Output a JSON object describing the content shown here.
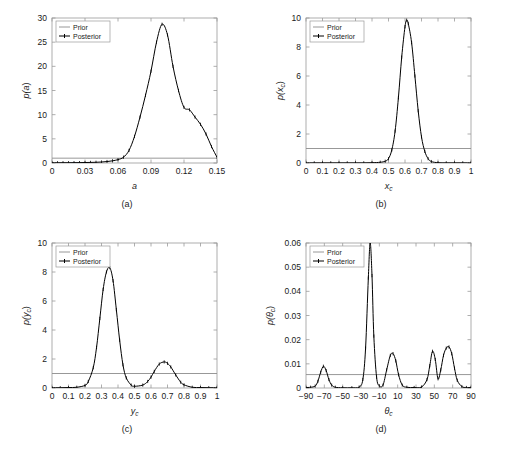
{
  "figure": {
    "panel_captions": [
      "(a)",
      "(b)",
      "(c)",
      "(d)"
    ],
    "legend": {
      "prior": "Prior",
      "posterior": "Posterior"
    },
    "colors": {
      "prior": "#8c8c8c",
      "posterior": "#000000",
      "axis": "#9a9a9a",
      "text": "#1a1a1a"
    }
  },
  "chart_data": [
    {
      "type": "line",
      "panel": "(a)",
      "title": "",
      "xlabel": "a",
      "ylabel": "p(a)",
      "xlim": [
        0,
        0.15
      ],
      "ylim": [
        0,
        30
      ],
      "xticks": [
        0,
        0.03,
        0.06,
        0.09,
        0.12,
        0.15
      ],
      "xticklabels": [
        "0",
        "0.03",
        "0.06",
        "0.09",
        "0.12",
        "0.15"
      ],
      "yticks": [
        0,
        5,
        10,
        15,
        20,
        25,
        30
      ],
      "yticklabels": [
        "0",
        "5",
        "10",
        "15",
        "20",
        "25",
        "30"
      ],
      "grid": false,
      "legend": [
        "Prior",
        "Posterior"
      ],
      "legend_position": "upper left",
      "series": [
        {
          "name": "Prior",
          "style": "solid-gray",
          "x": [
            0,
            0.15
          ],
          "values": [
            1.0,
            1.0
          ]
        },
        {
          "name": "Posterior",
          "style": "black-with-markers",
          "x": [
            0,
            0.005,
            0.01,
            0.015,
            0.02,
            0.025,
            0.03,
            0.035,
            0.04,
            0.045,
            0.05,
            0.055,
            0.06,
            0.065,
            0.07,
            0.075,
            0.08,
            0.085,
            0.09,
            0.095,
            0.1,
            0.105,
            0.11,
            0.115,
            0.12,
            0.125,
            0.13,
            0.135,
            0.14,
            0.145,
            0.15
          ],
          "values": [
            0.05,
            0.05,
            0.06,
            0.06,
            0.07,
            0.08,
            0.1,
            0.12,
            0.15,
            0.2,
            0.3,
            0.45,
            0.7,
            1.2,
            2.6,
            5.5,
            9.5,
            14.0,
            19.0,
            25.0,
            28.7,
            26.5,
            20.0,
            15.0,
            11.5,
            11.0,
            9.5,
            8.0,
            6.0,
            3.4,
            1.2
          ]
        }
      ]
    },
    {
      "type": "line",
      "panel": "(b)",
      "title": "",
      "xlabel": "x_c",
      "ylabel": "p(x_c)",
      "xlim": [
        0,
        1
      ],
      "ylim": [
        0,
        10
      ],
      "xticks": [
        0,
        0.1,
        0.2,
        0.3,
        0.4,
        0.5,
        0.6,
        0.7,
        0.8,
        0.9,
        1
      ],
      "xticklabels": [
        "0",
        "0.1",
        "0.2",
        "0.3",
        "0.4",
        "0.5",
        "0.6",
        "0.7",
        "0.8",
        "0.9",
        "1"
      ],
      "yticks": [
        0,
        2,
        4,
        6,
        8,
        10
      ],
      "yticklabels": [
        "0",
        "2",
        "4",
        "6",
        "8",
        "10"
      ],
      "grid": false,
      "legend": [
        "Prior",
        "Posterior"
      ],
      "legend_position": "upper left",
      "series": [
        {
          "name": "Prior",
          "style": "solid-gray",
          "x": [
            0,
            1
          ],
          "values": [
            1.0,
            1.0
          ]
        },
        {
          "name": "Posterior",
          "style": "black-with-markers",
          "x": [
            0,
            0.05,
            0.1,
            0.15,
            0.2,
            0.25,
            0.3,
            0.35,
            0.4,
            0.45,
            0.48,
            0.5,
            0.52,
            0.54,
            0.56,
            0.58,
            0.6,
            0.61,
            0.62,
            0.64,
            0.66,
            0.68,
            0.7,
            0.72,
            0.74,
            0.76,
            0.8,
            0.85,
            0.9,
            0.95,
            1
          ],
          "values": [
            0.01,
            0.01,
            0.01,
            0.01,
            0.01,
            0.01,
            0.01,
            0.01,
            0.02,
            0.05,
            0.12,
            0.3,
            0.9,
            2.2,
            4.5,
            7.3,
            9.4,
            9.85,
            9.6,
            8.3,
            6.0,
            3.6,
            1.8,
            0.8,
            0.3,
            0.1,
            0.02,
            0.01,
            0.01,
            0.01,
            0.01
          ]
        }
      ]
    },
    {
      "type": "line",
      "panel": "(c)",
      "title": "",
      "xlabel": "y_c",
      "ylabel": "p(y_c)",
      "xlim": [
        0,
        1
      ],
      "ylim": [
        0,
        10
      ],
      "xticks": [
        0,
        0.1,
        0.2,
        0.3,
        0.4,
        0.5,
        0.6,
        0.7,
        0.8,
        0.9,
        1
      ],
      "xticklabels": [
        "0",
        "0.1",
        "0.2",
        "0.3",
        "0.4",
        "0.5",
        "0.6",
        "0.7",
        "0.8",
        "0.9",
        "1"
      ],
      "yticks": [
        0,
        2,
        4,
        6,
        8,
        10
      ],
      "yticklabels": [
        "0",
        "2",
        "4",
        "6",
        "8",
        "10"
      ],
      "grid": false,
      "legend": [
        "Prior",
        "Posterior"
      ],
      "legend_position": "upper left",
      "series": [
        {
          "name": "Prior",
          "style": "solid-gray",
          "x": [
            0,
            1
          ],
          "values": [
            1.0,
            1.0
          ]
        },
        {
          "name": "Posterior",
          "style": "black-with-markers",
          "x": [
            0,
            0.05,
            0.1,
            0.15,
            0.2,
            0.22,
            0.25,
            0.27,
            0.29,
            0.31,
            0.33,
            0.35,
            0.37,
            0.39,
            0.41,
            0.43,
            0.45,
            0.48,
            0.5,
            0.55,
            0.58,
            0.6,
            0.62,
            0.65,
            0.68,
            0.7,
            0.72,
            0.75,
            0.78,
            0.8,
            0.85,
            0.9,
            0.95,
            1
          ],
          "values": [
            0.02,
            0.02,
            0.03,
            0.05,
            0.18,
            0.45,
            1.4,
            2.8,
            4.8,
            6.8,
            8.0,
            8.3,
            7.4,
            5.4,
            3.3,
            1.6,
            0.7,
            0.2,
            0.12,
            0.2,
            0.45,
            0.75,
            1.15,
            1.65,
            1.8,
            1.7,
            1.45,
            0.9,
            0.4,
            0.22,
            0.05,
            0.03,
            0.02,
            0.02
          ]
        }
      ]
    },
    {
      "type": "line",
      "panel": "(d)",
      "title": "",
      "xlabel": "theta_c",
      "ylabel": "p(theta_c)",
      "xlim": [
        -90,
        90
      ],
      "ylim": [
        0,
        0.06
      ],
      "xticks": [
        -90,
        -70,
        -50,
        -30,
        -10,
        10,
        30,
        50,
        70,
        90
      ],
      "xticklabels": [
        "−90",
        "−70",
        "−50",
        "−30",
        "−10",
        "10",
        "30",
        "50",
        "70",
        "90"
      ],
      "yticks": [
        0,
        0.01,
        0.02,
        0.03,
        0.04,
        0.05,
        0.06
      ],
      "yticklabels": [
        "0",
        "0.01",
        "0.02",
        "0.03",
        "0.04",
        "0.05",
        "0.06"
      ],
      "grid": false,
      "legend": [
        "Prior",
        "Posterior"
      ],
      "legend_position": "upper left",
      "series": [
        {
          "name": "Prior",
          "style": "solid-gray",
          "x": [
            -90,
            90
          ],
          "values": [
            0.00556,
            0.00556
          ]
        },
        {
          "name": "Posterior",
          "style": "black-with-markers",
          "x": [
            -90,
            -85,
            -80,
            -77,
            -74,
            -71,
            -68,
            -65,
            -62,
            -58,
            -50,
            -40,
            -32,
            -28,
            -25,
            -22,
            -20,
            -18,
            -16,
            -13,
            -10,
            -6,
            -2,
            2,
            5,
            8,
            11,
            15,
            20,
            28,
            36,
            42,
            45,
            48,
            51,
            54,
            57,
            60,
            63,
            66,
            69,
            72,
            75,
            80,
            85,
            90
          ],
          "values": [
            0.0002,
            0.0003,
            0.0008,
            0.0028,
            0.0065,
            0.009,
            0.0072,
            0.0035,
            0.0012,
            0.0003,
            0.0001,
            0.0001,
            0.0004,
            0.0035,
            0.0165,
            0.0455,
            0.06,
            0.0465,
            0.0215,
            0.0045,
            0.0009,
            0.0012,
            0.0075,
            0.0135,
            0.0142,
            0.0112,
            0.0055,
            0.0012,
            0.0003,
            0.0002,
            0.0004,
            0.0035,
            0.0092,
            0.0152,
            0.0118,
            0.0038,
            0.0075,
            0.0135,
            0.0165,
            0.017,
            0.0142,
            0.0082,
            0.0032,
            0.0006,
            0.0002,
            0.0002
          ]
        }
      ]
    }
  ]
}
